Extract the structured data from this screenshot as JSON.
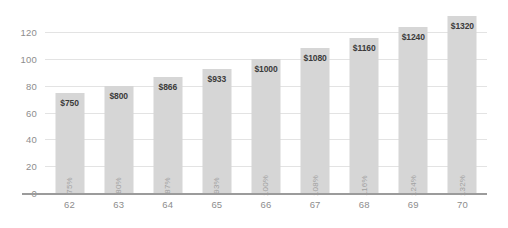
{
  "chart_data": {
    "type": "bar",
    "title": "",
    "subtitle": "",
    "xlabel": "",
    "ylabel": "",
    "categories": [
      "62",
      "63",
      "64",
      "65",
      "66",
      "67",
      "68",
      "69",
      "70"
    ],
    "values": [
      75,
      80,
      87,
      93,
      100,
      108,
      116,
      124,
      132
    ],
    "value_labels": [
      "$750",
      "$800",
      "$866",
      "$933",
      "$1000",
      "$1080",
      "$1160",
      "$1240",
      "$1320"
    ],
    "percent_labels": [
      "75%",
      "80%",
      "87%",
      "93%",
      "100%",
      "108%",
      "116%",
      "124%",
      "132%"
    ],
    "ylim": [
      0,
      130
    ],
    "yticks": [
      "0",
      "20",
      "40",
      "60",
      "80",
      "100",
      "120"
    ],
    "ytick_values": [
      0,
      20,
      40,
      60,
      80,
      100,
      120
    ],
    "grid": true,
    "legend": "none",
    "series": [
      {
        "name": "",
        "values": [
          75,
          80,
          87,
          93,
          100,
          108,
          116,
          124,
          132
        ]
      }
    ],
    "colors": {
      "bar": "#d6d6d6",
      "gridline": "#e3e3e3",
      "axis": "#9b9b9b",
      "tick_text": "#8d8d8d",
      "value_text": "#3b3b3b",
      "percent_text": "#a2a2a2",
      "background": "#ffffff"
    }
  }
}
